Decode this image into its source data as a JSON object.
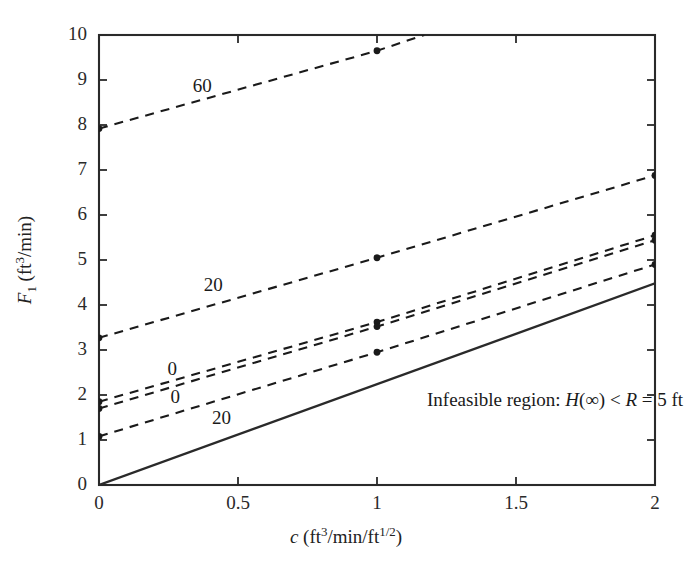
{
  "chart_data": {
    "type": "line",
    "title": "",
    "xlabel": "c (ft3/min/ft1/2)",
    "ylabel": "F1 (ft3/min)",
    "xlim": [
      0,
      2
    ],
    "ylim": [
      0,
      10
    ],
    "xticks": [
      "0",
      "0.5",
      "1",
      "1.5",
      "2"
    ],
    "xtick_values": [
      0,
      0.5,
      1,
      1.5,
      2
    ],
    "yticks": [
      "0",
      "1",
      "2",
      "3",
      "4",
      "5",
      "6",
      "7",
      "8",
      "9",
      "10"
    ],
    "ytick_values": [
      0,
      1,
      2,
      3,
      4,
      5,
      6,
      7,
      8,
      9,
      10
    ],
    "grid": false,
    "legend": "none",
    "series": [
      {
        "name": "60",
        "label": "60",
        "style": "dashed",
        "color": "#1a1a1a",
        "x": [
          0,
          1,
          1.17
        ],
        "y": [
          7.92,
          9.65,
          10.0
        ],
        "markers_x": [
          0,
          1
        ],
        "markers_y": [
          7.92,
          9.65
        ],
        "label_pos": [
          0.38,
          8.85
        ]
      },
      {
        "name": "20-upper",
        "label": "20",
        "style": "dashed",
        "color": "#1a1a1a",
        "x": [
          0,
          1,
          2
        ],
        "y": [
          3.27,
          5.05,
          6.88
        ],
        "markers_x": [
          0,
          1,
          2
        ],
        "markers_y": [
          3.27,
          5.05,
          6.88
        ],
        "label_pos": [
          0.42,
          4.42
        ]
      },
      {
        "name": "0-upper",
        "label": "0",
        "style": "dashed",
        "color": "#1a1a1a",
        "x": [
          0,
          1,
          2
        ],
        "y": [
          1.85,
          3.62,
          5.55
        ],
        "markers_x": [
          0,
          1,
          2
        ],
        "markers_y": [
          1.85,
          3.62,
          5.55
        ],
        "label_pos": [
          0.29,
          2.55
        ]
      },
      {
        "name": "0-lower",
        "label": "0",
        "style": "dashed",
        "color": "#1a1a1a",
        "x": [
          0,
          1,
          2
        ],
        "y": [
          1.7,
          3.52,
          5.44
        ],
        "markers_x": [
          0,
          1,
          2
        ],
        "markers_y": [
          1.7,
          3.52,
          5.44
        ],
        "label_pos": [
          0.3,
          1.93
        ]
      },
      {
        "name": "20-lower",
        "label": "20",
        "style": "dashed",
        "color": "#1a1a1a",
        "x": [
          0,
          1,
          2
        ],
        "y": [
          1.08,
          2.95,
          4.9
        ],
        "markers_x": [
          0,
          1,
          2
        ],
        "markers_y": [
          1.08,
          2.95,
          4.9
        ],
        "label_pos": [
          0.45,
          1.47
        ]
      },
      {
        "name": "infeasible-boundary",
        "label": "",
        "style": "solid",
        "color": "#2a2a2a",
        "x": [
          0,
          2
        ],
        "y": [
          0,
          4.48
        ],
        "markers_x": [],
        "markers_y": [],
        "label_pos": null
      }
    ],
    "annotations": [
      {
        "name": "infeasible-region-note",
        "text": "Infeasible region: H(∞) < R = 5 ft",
        "x": 1.18,
        "y": 1.85
      }
    ]
  },
  "axes": {
    "ylabel_parts": {
      "symbol": "F",
      "sub": "1",
      "unit_pre": " (ft",
      "unit_sup": "3",
      "unit_post": "/min)"
    },
    "xlabel_parts": {
      "symbol": "c",
      "unit_pre": " (ft",
      "unit_sup": "3",
      "unit_mid": "/min/ft",
      "unit_sup2": "1/2",
      "unit_post": ")"
    }
  },
  "annotation_parts": {
    "lead": "Infeasible region: ",
    "h_symbol": "H",
    "inf": "(∞)",
    "lt": " < ",
    "r_symbol": "R",
    "tail": " = 5 ft"
  },
  "colors": {
    "axis": "#2a2a2a",
    "line": "#1a1a1a",
    "background": "#ffffff"
  }
}
